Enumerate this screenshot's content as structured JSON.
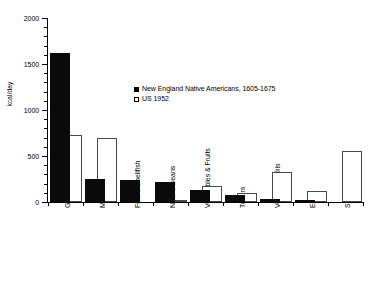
{
  "chart_data": {
    "type": "bar",
    "title": "",
    "xlabel": "",
    "ylabel": "kcal/day",
    "ylim": [
      0,
      2000
    ],
    "yticks": [
      0,
      500,
      1000,
      1500,
      2000
    ],
    "ytick_labels": [
      "0",
      "500",
      "1000",
      "1500",
      "2000"
    ],
    "grid": false,
    "legend_position": "inside-upper-center",
    "categories": [
      "Grain",
      "Meat & Fowl",
      "Fish & Shellfish",
      "Nuts & Beans",
      "Vegetables & Fruits",
      "Tubers",
      "Vegetable Oils",
      "Eggs",
      "Sugar"
    ],
    "series": [
      {
        "name": "New England Native Americans, 1605-1675",
        "style": "filled-black",
        "color": "#000000",
        "values": [
          1620,
          255,
          240,
          215,
          130,
          75,
          30,
          25,
          0
        ]
      },
      {
        "name": "US 1952",
        "style": "open-white",
        "color": "#ffffff",
        "values": [
          730,
          700,
          0,
          20,
          175,
          100,
          330,
          115,
          555
        ]
      }
    ]
  },
  "legend": {
    "entries": [
      {
        "label": "New England Native Americans, 1605-1675",
        "swatch": "filled-square"
      },
      {
        "label": "US 1952",
        "swatch": "open-square"
      }
    ]
  },
  "axes": {
    "y_title": "kcal/day",
    "y_labels": [
      "2000",
      "1500",
      "1000",
      "500",
      "0"
    ]
  }
}
